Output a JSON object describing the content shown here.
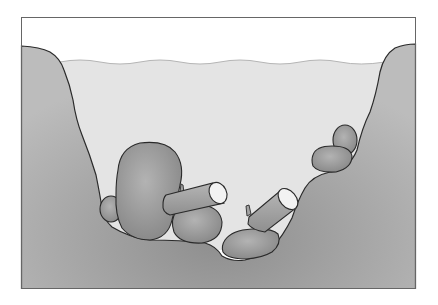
{
  "diagram": {
    "colors": {
      "background": "#ffffff",
      "frame": "#666666",
      "sky": "#ffffff",
      "water": "#e4e4e4",
      "water_surface_line": "#b5b5b5",
      "bank_light": "#b9b9b9",
      "bank_dark": "#8e8e8e",
      "rock_light": "#b0b0b0",
      "rock_dark": "#8a8a8a",
      "log": "#a3a3a3",
      "log_end": "#f2f2f2",
      "outline": "#2a2a2a"
    },
    "elements": [
      {
        "name": "left-bank",
        "type": "bank"
      },
      {
        "name": "right-bank",
        "type": "bank"
      },
      {
        "name": "water",
        "type": "water"
      },
      {
        "name": "large-boulder",
        "type": "rock"
      },
      {
        "name": "small-rock-left",
        "type": "rock"
      },
      {
        "name": "round-rock-center",
        "type": "rock"
      },
      {
        "name": "flat-rock-bottom",
        "type": "rock"
      },
      {
        "name": "rock-right-upper",
        "type": "rock"
      },
      {
        "name": "rock-right-lower",
        "type": "rock"
      },
      {
        "name": "log-left",
        "type": "log"
      },
      {
        "name": "log-right",
        "type": "log"
      }
    ]
  }
}
